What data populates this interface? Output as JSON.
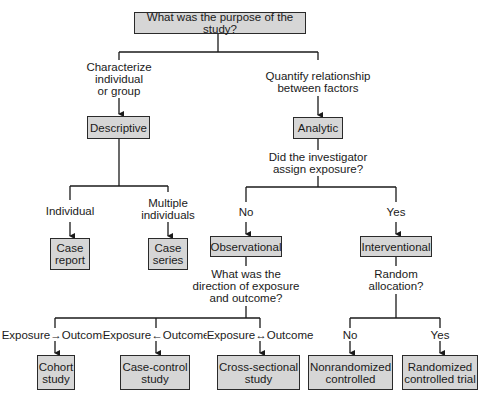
{
  "title": "What was the purpose of the study?",
  "level1": {
    "left": {
      "edge_label": "Characterize\nindividual\nor group",
      "node": "Descriptive"
    },
    "right": {
      "edge_label": "Quantify relationship\nbetween factors",
      "node": "Analytic"
    }
  },
  "descriptive": {
    "children": [
      {
        "edge_label": "Individual",
        "node": "Case\nreport"
      },
      {
        "edge_label": "Multiple\nindividuals",
        "node": "Case\nseries"
      }
    ]
  },
  "analytic": {
    "question": "Did the investigator\nassign exposure?",
    "children": [
      {
        "edge_label": "No",
        "node": "Observational"
      },
      {
        "edge_label": "Yes",
        "node": "Interventional"
      }
    ]
  },
  "observational": {
    "question": "What was the\ndirection of exposure\nand outcome?",
    "children": [
      {
        "edge_label": "Exposure→Outcome",
        "node": "Cohort\nstudy"
      },
      {
        "edge_label": "Exposure←Outcome",
        "node": "Case-control\nstudy"
      },
      {
        "edge_label": "Exposure↔Outcome",
        "node": "Cross-sectional\nstudy"
      }
    ]
  },
  "interventional": {
    "question": "Random\nallocation?",
    "children": [
      {
        "edge_label": "No",
        "node": "Nonrandomized\ncontrolled"
      },
      {
        "edge_label": "Yes",
        "node": "Randomized\ncontrolled trial"
      }
    ]
  },
  "colors": {
    "box_fill": "#d6d6d6",
    "box_border": "#2a2a2a",
    "line": "#1a1a1a"
  }
}
